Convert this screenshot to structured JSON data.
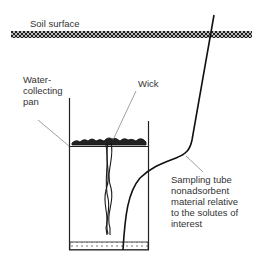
{
  "diagram": {
    "type": "lysimeter-cross-section",
    "labels": {
      "soil_surface": "Soil surface",
      "water_collecting_pan": [
        "Water-",
        "collecting",
        "pan"
      ],
      "wick": "Wick",
      "sampling_tube": [
        "Sampling tube",
        "nonadsorbent",
        "material relative",
        "to the solutes of",
        "interest"
      ]
    },
    "components": [
      {
        "name": "soil-surface-band",
        "description": "hatched band representing ground surface"
      },
      {
        "name": "water-collecting-pan",
        "description": "open rectangular container"
      },
      {
        "name": "wick",
        "description": "braided wick hanging from top layer into pan"
      },
      {
        "name": "sampling-tube",
        "description": "tube from above surface down into bottom of pan"
      },
      {
        "name": "pan-bottom-layer",
        "description": "dotted layer at bottom of pan"
      }
    ],
    "colors": {
      "line": "#1a1a1a",
      "text": "#333333",
      "leader": "#777777",
      "background": "#ffffff"
    }
  }
}
